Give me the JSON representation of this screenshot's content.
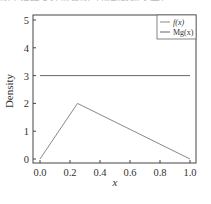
{
  "header_fragment": "图 2 拒绝采样示意图（顶部截断文字）",
  "chart_data": {
    "type": "line",
    "title": "",
    "xlabel": "x",
    "ylabel": "Density",
    "xlim": [
      0.0,
      1.0
    ],
    "ylim": [
      0,
      5
    ],
    "xticks": [
      "0.0",
      "0.2",
      "0.4",
      "0.6",
      "0.8",
      "1.0"
    ],
    "yticks": [
      "0",
      "1",
      "2",
      "3",
      "4",
      "5"
    ],
    "grid": false,
    "legend_position": "upper right",
    "series": [
      {
        "name": "f(x)",
        "x": [
          0.0,
          0.25,
          1.0
        ],
        "y": [
          0.0,
          2.0,
          0.0
        ],
        "color": "#888888"
      },
      {
        "name": "Mg(x)",
        "x": [
          0.0,
          1.0
        ],
        "y": [
          3.0,
          3.0
        ],
        "color": "#666666"
      }
    ]
  }
}
